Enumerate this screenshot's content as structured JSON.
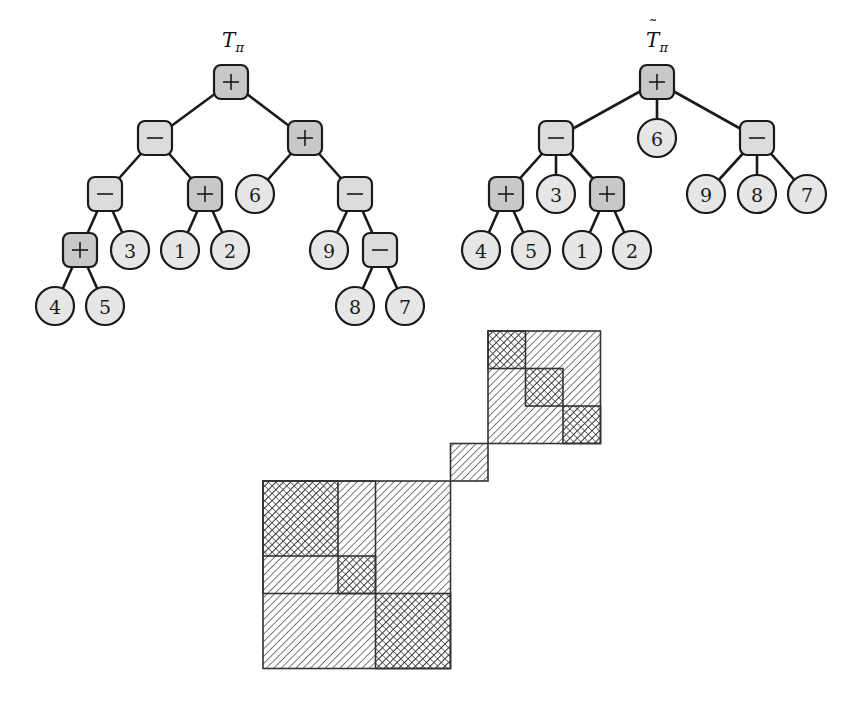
{
  "colors": {
    "op_plus_fill": "#c8c8c8",
    "op_minus_fill": "#dcdcdc",
    "leaf_fill": "#e6e6e6",
    "line": "#1a1a1a",
    "hatch": "#333333"
  },
  "trees": [
    {
      "id": "T",
      "title_main": "T",
      "title_sub": "π",
      "title_tilde": false,
      "title_pos": [
        233,
        47
      ],
      "nodes": [
        {
          "id": "a",
          "type": "op",
          "op": "+",
          "pos": [
            231,
            82
          ]
        },
        {
          "id": "b",
          "type": "op",
          "op": "-",
          "pos": [
            155,
            138
          ],
          "parent": "a"
        },
        {
          "id": "c",
          "type": "op",
          "op": "+",
          "pos": [
            305,
            138
          ],
          "parent": "a"
        },
        {
          "id": "d",
          "type": "op",
          "op": "-",
          "pos": [
            105,
            194
          ],
          "parent": "b"
        },
        {
          "id": "e",
          "type": "op",
          "op": "+",
          "pos": [
            205,
            194
          ],
          "parent": "b"
        },
        {
          "id": "f",
          "type": "leaf",
          "label": "6",
          "pos": [
            255,
            194
          ],
          "parent": "c"
        },
        {
          "id": "g",
          "type": "op",
          "op": "-",
          "pos": [
            355,
            194
          ],
          "parent": "c"
        },
        {
          "id": "h",
          "type": "op",
          "op": "+",
          "pos": [
            80,
            250
          ],
          "parent": "d"
        },
        {
          "id": "i",
          "type": "leaf",
          "label": "3",
          "pos": [
            130,
            250
          ],
          "parent": "d"
        },
        {
          "id": "j",
          "type": "leaf",
          "label": "1",
          "pos": [
            180,
            250
          ],
          "parent": "e"
        },
        {
          "id": "k",
          "type": "leaf",
          "label": "2",
          "pos": [
            230,
            250
          ],
          "parent": "e"
        },
        {
          "id": "l",
          "type": "leaf",
          "label": "9",
          "pos": [
            329,
            250
          ],
          "parent": "g"
        },
        {
          "id": "m",
          "type": "op",
          "op": "-",
          "pos": [
            380,
            250
          ],
          "parent": "g"
        },
        {
          "id": "n",
          "type": "leaf",
          "label": "4",
          "pos": [
            55,
            306
          ],
          "parent": "h"
        },
        {
          "id": "o",
          "type": "leaf",
          "label": "5",
          "pos": [
            105,
            306
          ],
          "parent": "h"
        },
        {
          "id": "p",
          "type": "leaf",
          "label": "8",
          "pos": [
            355,
            306
          ],
          "parent": "m"
        },
        {
          "id": "q",
          "type": "leaf",
          "label": "7",
          "pos": [
            405,
            306
          ],
          "parent": "m"
        }
      ]
    },
    {
      "id": "T-tilde",
      "title_main": "T",
      "title_sub": "π",
      "title_tilde": true,
      "title_pos": [
        657,
        47
      ],
      "nodes": [
        {
          "id": "a",
          "type": "op",
          "op": "+",
          "pos": [
            657,
            82
          ]
        },
        {
          "id": "b",
          "type": "op",
          "op": "-",
          "pos": [
            556,
            138
          ],
          "parent": "a"
        },
        {
          "id": "c",
          "type": "leaf",
          "label": "6",
          "pos": [
            657,
            138
          ],
          "parent": "a"
        },
        {
          "id": "d",
          "type": "op",
          "op": "-",
          "pos": [
            757,
            138
          ],
          "parent": "a"
        },
        {
          "id": "e",
          "type": "op",
          "op": "+",
          "pos": [
            506,
            194
          ],
          "parent": "b"
        },
        {
          "id": "f",
          "type": "leaf",
          "label": "3",
          "pos": [
            556,
            194
          ],
          "parent": "b"
        },
        {
          "id": "g",
          "type": "op",
          "op": "+",
          "pos": [
            607,
            194
          ],
          "parent": "b"
        },
        {
          "id": "h",
          "type": "leaf",
          "label": "9",
          "pos": [
            706,
            194
          ],
          "parent": "d"
        },
        {
          "id": "i",
          "type": "leaf",
          "label": "8",
          "pos": [
            757,
            194
          ],
          "parent": "d"
        },
        {
          "id": "j",
          "type": "leaf",
          "label": "7",
          "pos": [
            807,
            194
          ],
          "parent": "d"
        },
        {
          "id": "k",
          "type": "leaf",
          "label": "4",
          "pos": [
            481,
            250
          ],
          "parent": "e"
        },
        {
          "id": "l",
          "type": "leaf",
          "label": "5",
          "pos": [
            531,
            250
          ],
          "parent": "e"
        },
        {
          "id": "m",
          "type": "leaf",
          "label": "1",
          "pos": [
            582,
            250
          ],
          "parent": "g"
        },
        {
          "id": "n",
          "type": "leaf",
          "label": "2",
          "pos": [
            632,
            250
          ],
          "parent": "g"
        }
      ]
    }
  ],
  "matrix": {
    "size": 9,
    "origin": [
      263,
      331
    ],
    "unit": 37.5,
    "blocks": [
      {
        "name": "block-top-right-outer",
        "row": 0,
        "col": 6,
        "rows": 3,
        "cols": 3,
        "pattern": "diag"
      },
      {
        "name": "block-top-right-cell-1",
        "row": 0,
        "col": 6,
        "rows": 1,
        "cols": 1,
        "pattern": "cross"
      },
      {
        "name": "block-top-right-cell-2",
        "row": 1,
        "col": 7,
        "rows": 1,
        "cols": 1,
        "pattern": "cross"
      },
      {
        "name": "block-top-right-cell-3",
        "row": 2,
        "col": 8,
        "rows": 1,
        "cols": 1,
        "pattern": "cross"
      },
      {
        "name": "block-middle-single",
        "row": 3,
        "col": 5,
        "rows": 1,
        "cols": 1,
        "pattern": "diag"
      },
      {
        "name": "block-bottom-left-outer",
        "row": 4,
        "col": 0,
        "rows": 5,
        "cols": 5,
        "pattern": "diag"
      },
      {
        "name": "block-bottom-left-cell-1",
        "row": 4,
        "col": 0,
        "rows": 2,
        "cols": 2,
        "pattern": "cross"
      },
      {
        "name": "block-bottom-left-cell-2",
        "row": 6,
        "col": 2,
        "rows": 1,
        "cols": 1,
        "pattern": "cross"
      },
      {
        "name": "block-bottom-left-cell-3",
        "row": 7,
        "col": 3,
        "rows": 2,
        "cols": 2,
        "pattern": "cross"
      },
      {
        "name": "block-bottom-left-upper-left-group",
        "row": 4,
        "col": 0,
        "rows": 3,
        "cols": 3,
        "pattern": "outline"
      }
    ]
  }
}
